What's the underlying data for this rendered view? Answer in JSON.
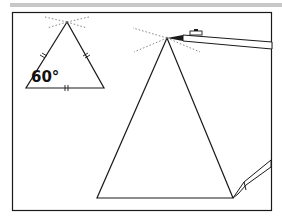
{
  "figure": {
    "small_triangle": {
      "angle_label": "60°",
      "type": "equilateral",
      "tick_marks": "each side marked with equal-length ticks"
    },
    "large_triangle": {
      "description": "triangle being drawn with a pencil at its apex"
    },
    "icons": [
      "pencil-icon"
    ],
    "colors": {
      "line": "#1a1a1a",
      "dotted": "#666666",
      "topbar": "#c8c8c8",
      "background": "#ffffff"
    }
  }
}
